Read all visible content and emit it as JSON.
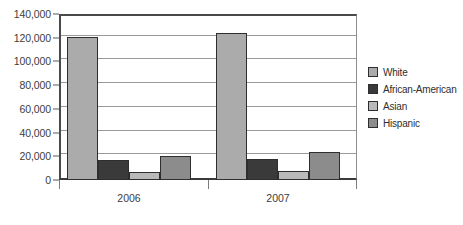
{
  "chart_data": {
    "type": "bar",
    "title": "",
    "subtitle": "",
    "xlabel": "",
    "ylabel": "",
    "categories": [
      "2006",
      "2007"
    ],
    "series": [
      {
        "name": "White",
        "color": "#ABABAB",
        "values": [
          121000,
          124000
        ]
      },
      {
        "name": "African-American",
        "color": "#3A3A3A",
        "values": [
          17000,
          18000
        ]
      },
      {
        "name": "Asian",
        "color": "#B9B9B9",
        "values": [
          6500,
          7500
        ]
      },
      {
        "name": "Hispanic",
        "color": "#8C8C8C",
        "values": [
          20500,
          23500
        ]
      }
    ],
    "ylim": [
      0,
      140000
    ],
    "ytick_values": [
      0,
      20000,
      40000,
      60000,
      80000,
      100000,
      120000,
      140000
    ],
    "ytick_labels": [
      "0",
      "20,000",
      "40,000",
      "60,000",
      "80,000",
      "100,000",
      "120,000",
      "140,000"
    ],
    "grid": true,
    "grid_axis": "y",
    "legend_position": "right",
    "legend_entries": [
      "White",
      "African-American",
      "Asian",
      "Hispanic"
    ]
  }
}
